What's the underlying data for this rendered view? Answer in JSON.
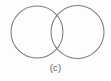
{
  "figure": {
    "caption": "(c)",
    "background_color": "#fdfdfd",
    "stroke_color": "#7e7e82",
    "caption_color": "#5d5d61",
    "shapes": [
      {
        "name": "left-circle",
        "cx": 37,
        "cy": 32,
        "r": 26
      },
      {
        "name": "right-circle",
        "cx": 77.5,
        "cy": 32,
        "r": 26.5
      }
    ]
  }
}
